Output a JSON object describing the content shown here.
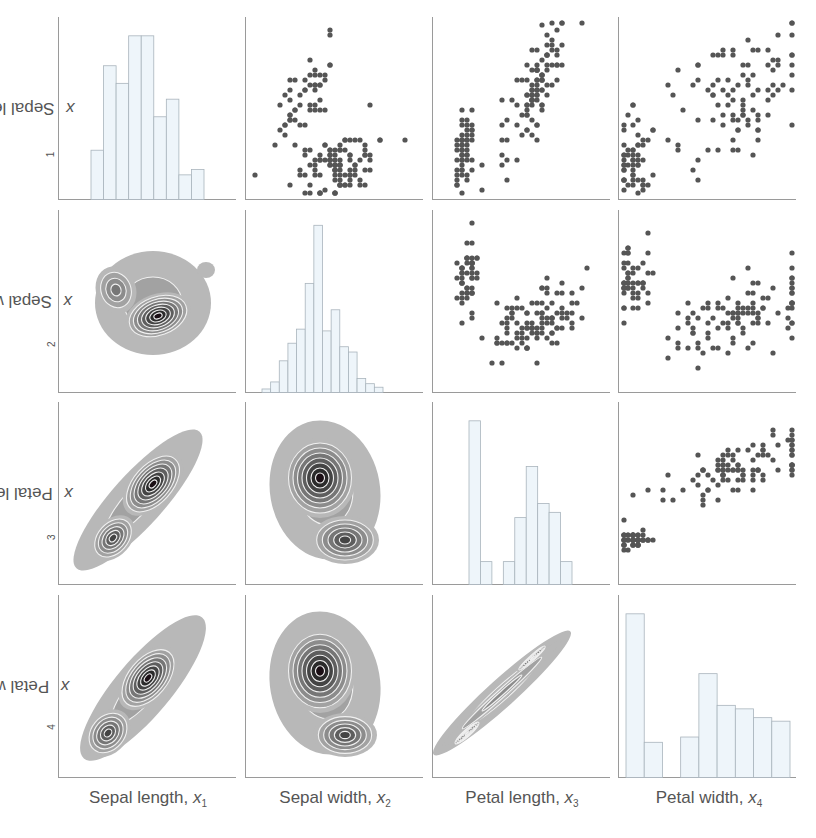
{
  "chart_data": {
    "type": "pairplot",
    "title": "",
    "variables": [
      {
        "name": "Sepal length",
        "symbol": "x",
        "index": "1"
      },
      {
        "name": "Sepal width",
        "symbol": "x",
        "index": "2"
      },
      {
        "name": "Petal length",
        "symbol": "x",
        "index": "3"
      },
      {
        "name": "Petal width",
        "symbol": "x",
        "index": "4"
      }
    ],
    "layout": {
      "upper_triangle": "scatter",
      "diagonal": "histogram",
      "lower_triangle": "kde_contour_filled",
      "grid": false,
      "legend": "none"
    },
    "colors": {
      "hist_fill": "#eef5fa",
      "hist_edge": "#a9b4bc",
      "scatter": "#555555",
      "kde_outer": "#b5b5b5",
      "kde_inner": "#1a0e14",
      "axis": "#9a9a9a"
    },
    "histograms": [
      {
        "variable": "Sepal length",
        "relative_heights": [
          0.28,
          0.76,
          0.66,
          0.93,
          0.93,
          0.47,
          0.57,
          0.14,
          0.17
        ]
      },
      {
        "variable": "Sepal width",
        "relative_heights": [
          0.02,
          0.06,
          0.18,
          0.28,
          0.36,
          0.62,
          0.95,
          0.35,
          0.47,
          0.26,
          0.23,
          0.08,
          0.05,
          0.03
        ]
      },
      {
        "variable": "Petal length",
        "relative_heights": [
          0.93,
          0.13,
          0,
          0.13,
          0.38,
          0.67,
          0.46,
          0.41,
          0.13
        ]
      },
      {
        "variable": "Petal width",
        "relative_heights": [
          0.93,
          0.2,
          0,
          0.23,
          0.59,
          0.41,
          0.39,
          0.34,
          0.32
        ]
      }
    ],
    "scatter_panels": [
      {
        "x": "Sepal width",
        "y": "Sepal length"
      },
      {
        "x": "Petal length",
        "y": "Sepal length"
      },
      {
        "x": "Petal width",
        "y": "Sepal length"
      },
      {
        "x": "Petal length",
        "y": "Sepal width"
      },
      {
        "x": "Petal width",
        "y": "Sepal width"
      },
      {
        "x": "Petal width",
        "y": "Petal length"
      }
    ],
    "contour_panels": [
      {
        "x": "Sepal length",
        "y": "Sepal width"
      },
      {
        "x": "Sepal length",
        "y": "Petal length"
      },
      {
        "x": "Sepal width",
        "y": "Petal length"
      },
      {
        "x": "Sepal length",
        "y": "Petal width"
      },
      {
        "x": "Sepal width",
        "y": "Petal width"
      },
      {
        "x": "Petal length",
        "y": "Petal width"
      }
    ]
  },
  "labels": {
    "x": [
      {
        "text": "Sepal length, ",
        "var": "x",
        "sub": "1"
      },
      {
        "text": "Sepal width, ",
        "var": "x",
        "sub": "2"
      },
      {
        "text": "Petal length, ",
        "var": "x",
        "sub": "3"
      },
      {
        "text": "Petal width, ",
        "var": "x",
        "sub": "4"
      }
    ],
    "y": [
      {
        "text": "Sepal length, ",
        "var": "x",
        "sub": "1"
      },
      {
        "text": "Sepal width, ",
        "var": "x",
        "sub": "2"
      },
      {
        "text": "Petal length, ",
        "var": "x",
        "sub": "3"
      },
      {
        "text": "Petal width, ",
        "var": "x",
        "sub": "4"
      }
    ]
  }
}
